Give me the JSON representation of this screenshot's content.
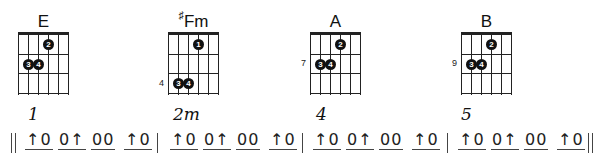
{
  "chords": [
    {
      "name": "E",
      "sharp": false,
      "left": 18,
      "fret_label": "",
      "fret_label_row": 0,
      "dots": [
        {
          "finger": "2",
          "string": 4,
          "fret": 1
        },
        {
          "finger": "3",
          "string": 2,
          "fret": 2
        },
        {
          "finger": "4",
          "string": 3,
          "fret": 2
        }
      ]
    },
    {
      "name": "Fm",
      "sharp": true,
      "sharp_symbol": "♯",
      "left": 168,
      "fret_label": "4",
      "fret_label_row": 3,
      "dots": [
        {
          "finger": "1",
          "string": 4,
          "fret": 1
        },
        {
          "finger": "3",
          "string": 2,
          "fret": 3
        },
        {
          "finger": "4",
          "string": 3,
          "fret": 3
        }
      ]
    },
    {
      "name": "A",
      "sharp": false,
      "left": 310,
      "fret_label": "7",
      "fret_label_row": 2,
      "dots": [
        {
          "finger": "2",
          "string": 4,
          "fret": 1
        },
        {
          "finger": "3",
          "string": 2,
          "fret": 2
        },
        {
          "finger": "4",
          "string": 3,
          "fret": 2
        }
      ]
    },
    {
      "name": "B",
      "sharp": false,
      "left": 461,
      "fret_label": "9",
      "fret_label_row": 2,
      "dots": [
        {
          "finger": "2",
          "string": 4,
          "fret": 1
        },
        {
          "finger": "3",
          "string": 2,
          "fret": 2
        },
        {
          "finger": "4",
          "string": 3,
          "fret": 2
        }
      ]
    }
  ],
  "strum": {
    "measures": [
      {
        "number": "1",
        "left": 25,
        "groups": [
          "↑0",
          "0↑",
          "00",
          "↑0"
        ]
      },
      {
        "number": "2m",
        "left": 170,
        "groups": [
          "↑0",
          "0↑",
          "00",
          "↑0"
        ]
      },
      {
        "number": "4",
        "left": 313,
        "groups": [
          "↑0",
          "0↑",
          "00",
          "↑0"
        ]
      },
      {
        "number": "5",
        "left": 458,
        "groups": [
          "↑0",
          "0↑",
          "00",
          "↑0"
        ]
      }
    ],
    "bar_lines": [
      {
        "x": 11,
        "type": "double"
      },
      {
        "x": 157,
        "type": "single"
      },
      {
        "x": 302,
        "type": "single"
      },
      {
        "x": 447,
        "type": "single"
      },
      {
        "x": 588,
        "type": "double"
      }
    ]
  }
}
